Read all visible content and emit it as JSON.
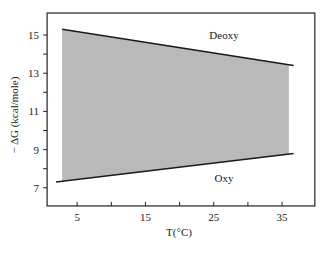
{
  "chart_data": {
    "type": "area",
    "title": "",
    "xlabel": "T(°C)",
    "ylabel": "− ΔG (kcal/mole)",
    "xlim": [
      0.6,
      39.8
    ],
    "ylim": [
      6.05,
      16.15
    ],
    "x_ticks_major": [
      5,
      15,
      25,
      35
    ],
    "x_ticks_minor": [
      10,
      20,
      30
    ],
    "y_ticks_major": [
      7,
      9,
      11,
      13,
      15
    ],
    "y_ticks_minor": [
      8,
      10,
      12,
      14
    ],
    "grid": false,
    "legend": null,
    "series": [
      {
        "name": "Deoxy",
        "kind": "line",
        "x": [
          2.8,
          36.7
        ],
        "y": [
          15.3,
          13.4
        ],
        "label_position": {
          "x": 26.5,
          "y": 15.0
        }
      },
      {
        "name": "Oxy",
        "kind": "line",
        "x": [
          1.9,
          36.7
        ],
        "y": [
          7.3,
          8.8
        ],
        "label_position": {
          "x": 26.5,
          "y": 7.5
        }
      }
    ],
    "shaded_band": {
      "x": [
        2.8,
        36.0
      ],
      "upper": [
        15.3,
        13.45
      ],
      "lower": [
        7.35,
        8.75
      ],
      "color": "#b9b9b9"
    },
    "annotations": [
      "Deoxy",
      "Oxy"
    ]
  },
  "colors": {
    "line": "#1a1a1a",
    "axis": "#222222",
    "fill": "#b9b9b9",
    "background": "#ffffff"
  }
}
